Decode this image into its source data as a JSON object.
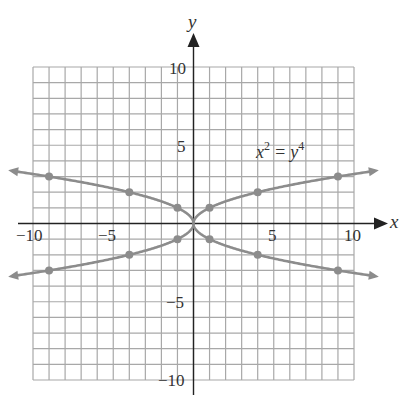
{
  "chart_data": {
    "type": "line",
    "title": "",
    "equation_label": {
      "base_x": "x",
      "exp_x": "2",
      "equals": "=",
      "base_y": "y",
      "exp_y": "4"
    },
    "xlabel": "x",
    "ylabel": "y",
    "xlim": [
      -10,
      10
    ],
    "ylim": [
      -10,
      10
    ],
    "grid": true,
    "grid_step": 1,
    "x_tick_labels": [
      "−10",
      "−5",
      "5",
      "10"
    ],
    "y_tick_labels": [
      "10",
      "5",
      "−5",
      "−10"
    ],
    "series": [
      {
        "name": "x^2 = y^4 (upper right, y = sqrt(x))",
        "points": [
          [
            1,
            1
          ],
          [
            4,
            2
          ],
          [
            9,
            3
          ]
        ]
      },
      {
        "name": "x^2 = y^4 (upper left, y = sqrt(-x))",
        "points": [
          [
            -1,
            1
          ],
          [
            -4,
            2
          ],
          [
            -9,
            3
          ]
        ]
      },
      {
        "name": "x^2 = y^4 (lower right, y = -sqrt(x))",
        "points": [
          [
            1,
            -1
          ],
          [
            4,
            -2
          ],
          [
            9,
            -3
          ]
        ]
      },
      {
        "name": "x^2 = y^4 (lower left, y = -sqrt(-x))",
        "points": [
          [
            -1,
            -1
          ],
          [
            -4,
            -2
          ],
          [
            -9,
            -3
          ]
        ]
      }
    ],
    "colors": {
      "curve": "#8c8c8c",
      "grid": "#a8a8a8",
      "axis": "#222222",
      "text": "#333333"
    }
  }
}
